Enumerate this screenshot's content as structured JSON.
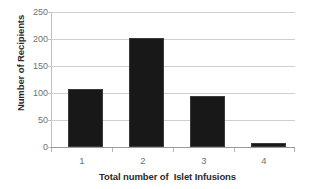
{
  "chart_data": {
    "type": "bar",
    "title": "",
    "categories": [
      "1",
      "2",
      "3",
      "4"
    ],
    "values": [
      107,
      202,
      95,
      8
    ],
    "series": [
      {
        "name": "Number of Recipients",
        "values": [
          107,
          202,
          95,
          8
        ]
      }
    ],
    "xlabel": "Total number of  Islet Infusions",
    "ylabel": "Number of Recipients",
    "ylim": [
      0,
      250
    ],
    "yticks": [
      0,
      50,
      100,
      150,
      200,
      250
    ],
    "ytick_labels": [
      "0",
      "50",
      "100",
      "150",
      "200",
      "250"
    ],
    "xtick_labels": [
      "1",
      "2",
      "3",
      "4"
    ],
    "grid": true,
    "grid_axis": "y",
    "legend": false,
    "legend_position": "none",
    "colors": {
      "bar": "#181818",
      "bar_edge": "#3a3a3a",
      "gridline": "#cfcfcf",
      "axis_line": "#bdbdbd",
      "baseline": "#9a9a9a",
      "tick_label": "#6f6f6f",
      "axis_title": "#2b2b2b",
      "background": "#ffffff"
    }
  }
}
